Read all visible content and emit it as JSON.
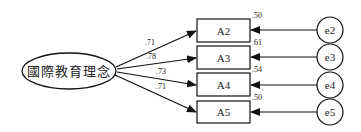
{
  "diagram": {
    "type": "structural-equation-model",
    "latent": {
      "label": "國際教育理念"
    },
    "indicators": [
      {
        "label": "A2",
        "loading": ".71",
        "r2": ".50",
        "error": "e2"
      },
      {
        "label": "A3",
        "loading": ".78",
        "r2": ".61",
        "error": "e3"
      },
      {
        "label": "A4",
        "loading": ".73",
        "r2": ".54",
        "error": "e4"
      },
      {
        "label": "A5",
        "loading": ".71",
        "r2": ".50",
        "error": "e5"
      }
    ]
  }
}
